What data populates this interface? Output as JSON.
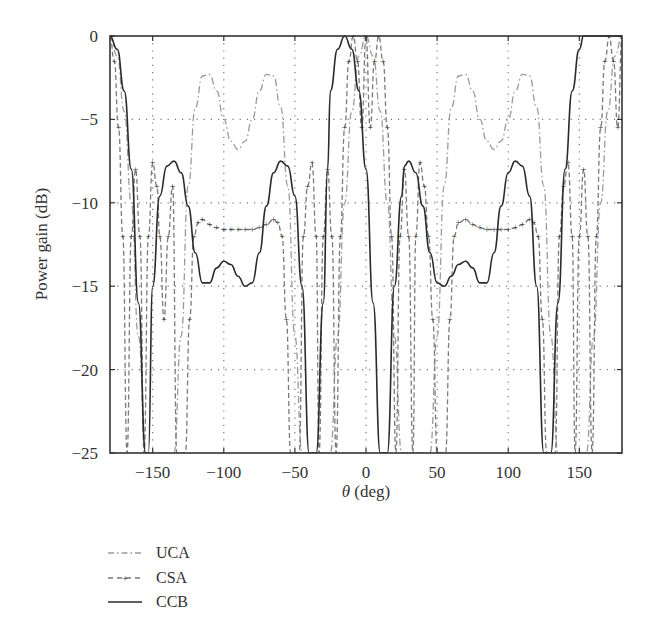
{
  "chart_data": {
    "type": "line",
    "title": "",
    "xlabel": "θ (deg)",
    "ylabel": "Power gain (dB)",
    "xlim": [
      -180,
      180
    ],
    "ylim": [
      -25,
      0
    ],
    "xticks": [
      -150,
      -100,
      -50,
      0,
      50,
      100,
      150
    ],
    "yticks": [
      0,
      -5,
      -10,
      -15,
      -20,
      -25
    ],
    "xtick_labels": [
      "−150",
      "−100",
      "−50",
      "0",
      "50",
      "100",
      "150"
    ],
    "ytick_labels": [
      "0",
      "−5",
      "−10",
      "−15",
      "−20",
      "−25"
    ],
    "grid": true,
    "legend_position": "below plot, left",
    "series": [
      {
        "name": "UCA",
        "style": "dash-dot, light gray",
        "color": "#9a9a9a",
        "x": [
          -180,
          -175,
          -170,
          -165,
          -160,
          -155,
          -150,
          -145,
          -140,
          -135,
          -130,
          -125,
          -120,
          -115,
          -110,
          -105,
          -100,
          -95,
          -90,
          -85,
          -80,
          -75,
          -70,
          -65,
          -60,
          -55,
          -50,
          -45,
          -40,
          -35,
          -30,
          -25,
          -20,
          -15,
          -10,
          -5,
          0,
          5,
          10,
          15,
          20,
          25,
          30,
          35,
          40,
          45,
          50,
          55,
          60,
          65,
          70,
          75,
          80,
          85,
          90,
          95,
          100,
          105,
          110,
          115,
          120,
          125,
          130,
          135,
          140,
          145,
          150,
          155,
          160,
          165,
          170,
          175,
          180
        ],
        "y": [
          0,
          -1.2,
          -4.5,
          -10,
          -18,
          -25,
          -25,
          -25,
          -25,
          -25,
          -18,
          -9,
          -4.3,
          -2.4,
          -2.3,
          -3.3,
          -5.0,
          -6.3,
          -6.8,
          -6.3,
          -5.0,
          -3.3,
          -2.3,
          -2.4,
          -4.3,
          -9,
          -18,
          -25,
          -25,
          -25,
          -25,
          -25,
          -18,
          -10,
          -4.5,
          -1.2,
          0,
          -1.2,
          -4.5,
          -10,
          -18,
          -25,
          -25,
          -25,
          -25,
          -25,
          -18,
          -9,
          -4.3,
          -2.4,
          -2.3,
          -3.3,
          -5.0,
          -6.3,
          -6.8,
          -6.3,
          -5.0,
          -3.3,
          -2.3,
          -2.4,
          -4.3,
          -9,
          -18,
          -25,
          -25,
          -25,
          -25,
          -25,
          -18,
          -10,
          -4.5,
          -1.2,
          0
        ]
      },
      {
        "name": "CSA",
        "style": "dashed with plus markers, gray",
        "color": "#7a7a7a",
        "x": [
          -180,
          -177,
          -174,
          -171,
          -168,
          -165,
          -162,
          -159,
          -156,
          -153,
          -150,
          -147,
          -145,
          -142,
          -139,
          -136,
          -133,
          -130,
          -127,
          -124,
          -121,
          -118,
          -115,
          -110,
          -105,
          -100,
          -95,
          -90,
          -85,
          -80,
          -75,
          -70,
          -65,
          -62,
          -59,
          -56,
          -53,
          -50,
          -47,
          -44,
          -41,
          -38,
          -35,
          -33,
          -30,
          -27,
          -24,
          -21,
          -18,
          -15,
          -12,
          -9,
          -6,
          -3,
          0,
          3,
          6,
          9,
          12,
          15,
          18,
          21,
          24,
          27,
          30,
          33,
          35,
          38,
          41,
          44,
          47,
          50,
          53,
          56,
          59,
          62,
          65,
          70,
          75,
          80,
          85,
          90,
          95,
          100,
          105,
          110,
          115,
          118,
          121,
          124,
          127,
          130,
          133,
          136,
          139,
          142,
          145,
          147,
          150,
          153,
          156,
          159,
          162,
          165,
          168,
          171,
          174,
          177,
          180
        ],
        "y": [
          0,
          -1.5,
          -5.5,
          -12,
          -25,
          -12,
          -8,
          -12,
          -25,
          -12,
          -7.6,
          -9,
          -12,
          -17,
          -12,
          -9,
          -25,
          -25,
          -25,
          -17,
          -12,
          -11.2,
          -11.0,
          -11.3,
          -11.5,
          -11.6,
          -11.6,
          -11.6,
          -11.6,
          -11.6,
          -11.5,
          -11.3,
          -11.0,
          -11.2,
          -12,
          -17,
          -25,
          -25,
          -25,
          -12,
          -9,
          -7.6,
          -12,
          -25,
          -12,
          -8,
          -12,
          -25,
          -12,
          -5.5,
          -1.5,
          0,
          -1.5,
          -5.5,
          0,
          -5.5,
          -1.5,
          0,
          -1.5,
          -5.5,
          -12,
          -25,
          -12,
          -8,
          -12,
          -25,
          -12,
          -7.6,
          -9,
          -12,
          -17,
          -25,
          -25,
          -25,
          -17,
          -12,
          -11.2,
          -11.0,
          -11.3,
          -11.5,
          -11.6,
          -11.6,
          -11.6,
          -11.6,
          -11.5,
          -11.3,
          -11.0,
          -11.2,
          -12,
          -17,
          -25,
          -25,
          -25,
          -12,
          -9,
          -7.6,
          -12,
          -25,
          -12,
          -8,
          -12,
          -25,
          -12,
          -5.5,
          -1.5,
          0,
          -1.5,
          -5.5,
          0
        ]
      },
      {
        "name": "CCB",
        "style": "solid, dark",
        "color": "#2a2a2a",
        "x": [
          -180,
          -175,
          -170,
          -165,
          -160,
          -155,
          -153,
          -150,
          -145,
          -140,
          -135,
          -130,
          -125,
          -120,
          -115,
          -110,
          -105,
          -100,
          -95,
          -90,
          -85,
          -80,
          -75,
          -70,
          -65,
          -60,
          -55,
          -50,
          -45,
          -40,
          -35,
          -30,
          -27,
          -25,
          -20,
          -15,
          -10,
          -5,
          0,
          5,
          10,
          15,
          20,
          25,
          27,
          30,
          35,
          40,
          45,
          50,
          55,
          60,
          65,
          70,
          75,
          80,
          85,
          90,
          95,
          100,
          105,
          110,
          115,
          120,
          125,
          130,
          135,
          140,
          145,
          150,
          153,
          155,
          160,
          165,
          170,
          175,
          180
        ],
        "y": [
          0,
          -0.8,
          -3.3,
          -8,
          -16,
          -25,
          -25,
          -15,
          -9.6,
          -7.8,
          -7.5,
          -8.2,
          -10.2,
          -13,
          -14.8,
          -14.8,
          -13.9,
          -13.5,
          -13.7,
          -14.4,
          -15.0,
          -14.8,
          -13,
          -10.2,
          -8.2,
          -7.5,
          -7.8,
          -9.6,
          -15,
          -25,
          -25,
          -16,
          -8,
          -3.3,
          -0.8,
          0,
          -0.8,
          -3.3,
          -8,
          -16,
          -25,
          -25,
          -15,
          -9.6,
          -7.8,
          -7.5,
          -8.2,
          -10.2,
          -13,
          -14.8,
          -15.0,
          -14.4,
          -13.7,
          -13.5,
          -13.9,
          -14.8,
          -14.8,
          -13,
          -10.2,
          -8.2,
          -7.5,
          -7.8,
          -9.6,
          -15,
          -25,
          -25,
          -16,
          -8,
          -3.3,
          -0.8,
          0,
          0,
          0,
          0,
          0,
          0,
          0
        ]
      }
    ]
  },
  "figure": {
    "xlabel_symbol": "θ",
    "xlabel_unit": " (deg)",
    "ylabel": "Power gain (dB)",
    "legend": [
      {
        "label": "UCA",
        "style": "dash-dot"
      },
      {
        "label": "CSA",
        "style": "dash-plus"
      },
      {
        "label": "CCB",
        "style": "solid"
      }
    ]
  }
}
